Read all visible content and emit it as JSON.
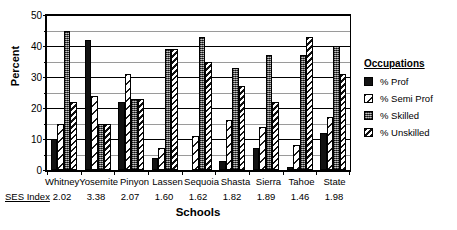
{
  "chart_data": {
    "type": "bar",
    "title": "",
    "xlabel": "Schools",
    "ylabel": "Percent",
    "ylim": [
      0,
      50
    ],
    "yticks": [
      0,
      10,
      20,
      30,
      40,
      50
    ],
    "yminor": [
      5,
      15,
      25,
      35,
      45
    ],
    "grid": true,
    "legend_position": "right",
    "legend_title": "Occupations",
    "categories": [
      "Whitney",
      "Yosemite",
      "Pinyon",
      "Lassen",
      "Sequoia",
      "Shasta",
      "Sierra",
      "Tahoe",
      "State"
    ],
    "secondary_axis": {
      "label": "SES Index",
      "values": [
        "2.02",
        "3.38",
        "2.07",
        "1.60",
        "1.62",
        "1.82",
        "1.89",
        "1.46",
        "1.98"
      ]
    },
    "series": [
      {
        "name": "% Prof",
        "pattern": "solid-black",
        "values": [
          10,
          42,
          22,
          4,
          0,
          3,
          7,
          1,
          12
        ]
      },
      {
        "name": "% Semi Prof",
        "pattern": "light-hatch",
        "values": [
          15,
          24,
          31,
          7,
          11,
          16,
          14,
          8,
          17
        ]
      },
      {
        "name": "% Skilled",
        "pattern": "dotted-gray",
        "values": [
          45,
          15,
          23,
          39,
          43,
          33,
          37,
          37,
          40
        ]
      },
      {
        "name": "% Unskilled",
        "pattern": "diagonal-hatch",
        "values": [
          22,
          15,
          23,
          39,
          35,
          27,
          22,
          43,
          31
        ]
      }
    ]
  },
  "colors": {
    "prof": "#121212",
    "semi_prof": "#ffffff",
    "skilled": "#5a5a5a",
    "unskilled": "#ffffff",
    "axis": "#000000",
    "background": "#ffffff"
  }
}
